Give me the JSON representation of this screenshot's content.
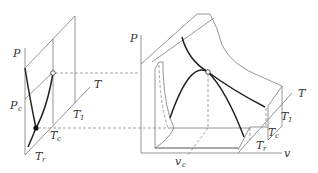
{
  "diagram": {
    "left_panel": {
      "title": "P-T projection",
      "axis_p": "P",
      "axis_t": "T",
      "label_pc_main": "P",
      "label_pc_sub": "c",
      "label_t1_main": "T",
      "label_t1_sub": "1",
      "label_tc_main": "T",
      "label_tc_sub": "c",
      "label_tr_main": "T",
      "label_tr_sub": "r"
    },
    "right_panel": {
      "title": "P-v-T surface",
      "axis_p": "P",
      "axis_t": "T",
      "axis_v": "v",
      "label_vc_main": "v",
      "label_vc_sub": "c",
      "label_t1_main": "T",
      "label_t1_sub": "1",
      "label_tc_main": "T",
      "label_tc_sub": "c",
      "label_tr_main": "T",
      "label_tr_sub": "r"
    },
    "colors": {
      "background": "#ffffff",
      "thin_line": "#7a7a7a",
      "thick_curve": "#222222",
      "dashed_line": "#8a8a8a",
      "label": "#333333"
    },
    "points": {
      "critical_point": "open-circle",
      "triple_point": "filled-circle"
    }
  }
}
